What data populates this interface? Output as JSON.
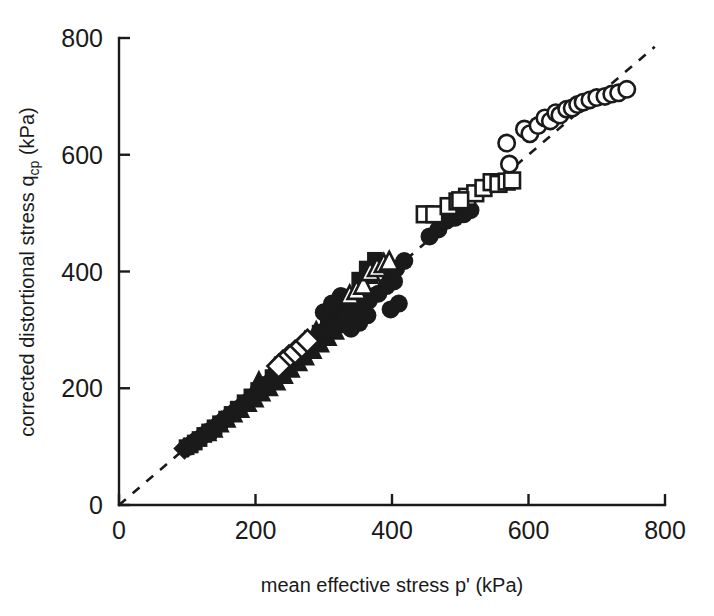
{
  "figure": {
    "background_color": "#ffffff",
    "ink_color": "#1a1a1a",
    "width": 714,
    "height": 616
  },
  "axes": {
    "x_title_main": "mean effective stress p' (kPa)",
    "y_title_part1": "corrected distortional stress q",
    "y_title_sub": "cp",
    "y_title_part2": " (kPa)",
    "x_ticks": [
      "0",
      "200",
      "400",
      "600",
      "800"
    ],
    "y_ticks": [
      "0",
      "200",
      "400",
      "600",
      "800"
    ]
  },
  "chart_data": {
    "type": "scatter",
    "title": "",
    "xlabel": "mean effective stress p' (kPa)",
    "ylabel": "corrected distortional stress q_cp (kPa)",
    "xlim": [
      0,
      800
    ],
    "ylim": [
      0,
      800
    ],
    "xticks": [
      0,
      200,
      400,
      600,
      800
    ],
    "yticks": [
      0,
      200,
      400,
      600,
      800
    ],
    "grid": false,
    "legend": "none",
    "annotations": [
      {
        "type": "reference-line",
        "style": "dashed",
        "description": "1:1 line through origin",
        "x": [
          0,
          785
        ],
        "y": [
          0,
          785
        ]
      }
    ],
    "series": [
      {
        "name": "filled-diamond",
        "marker": "diamond",
        "filled": true,
        "points": [
          [
            96,
            97
          ],
          [
            101,
            100
          ],
          [
            106,
            104
          ],
          [
            112,
            108
          ],
          [
            119,
            115
          ],
          [
            126,
            121
          ],
          [
            133,
            127
          ],
          [
            141,
            134
          ],
          [
            150,
            143
          ],
          [
            158,
            150
          ],
          [
            166,
            157
          ],
          [
            176,
            166
          ],
          [
            186,
            175
          ],
          [
            196,
            186
          ],
          [
            206,
            196
          ],
          [
            216,
            206
          ],
          [
            226,
            216
          ],
          [
            238,
            228
          ],
          [
            248,
            238
          ],
          [
            258,
            250
          ],
          [
            268,
            262
          ],
          [
            278,
            272
          ]
        ]
      },
      {
        "name": "filled-triangle",
        "marker": "triangle",
        "filled": true,
        "points": [
          [
            131,
            122
          ],
          [
            140,
            128
          ],
          [
            149,
            137
          ],
          [
            159,
            145
          ],
          [
            169,
            154
          ],
          [
            179,
            162
          ],
          [
            190,
            172
          ],
          [
            200,
            180
          ],
          [
            210,
            190
          ],
          [
            221,
            199
          ],
          [
            232,
            209
          ],
          [
            243,
            220
          ],
          [
            253,
            231
          ],
          [
            264,
            242
          ],
          [
            274,
            252
          ],
          [
            285,
            263
          ],
          [
            296,
            274
          ],
          [
            307,
            285
          ],
          [
            318,
            296
          ],
          [
            329,
            307
          ],
          [
            205,
            214
          ],
          [
            228,
            238
          ],
          [
            251,
            258
          ],
          [
            272,
            283
          ],
          [
            289,
            300
          ],
          [
            302,
            312
          ],
          [
            312,
            322
          ],
          [
            322,
            330
          ]
        ]
      },
      {
        "name": "filled-square",
        "marker": "square",
        "filled": true,
        "points": [
          [
            99,
            99
          ],
          [
            105,
            102
          ],
          [
            111,
            107
          ],
          [
            118,
            113
          ],
          [
            125,
            120
          ],
          [
            132,
            126
          ],
          [
            140,
            133
          ],
          [
            148,
            140
          ],
          [
            157,
            148
          ],
          [
            165,
            156
          ],
          [
            174,
            165
          ],
          [
            184,
            176
          ],
          [
            194,
            186
          ],
          [
            204,
            197
          ],
          [
            214,
            207
          ],
          [
            225,
            219
          ],
          [
            236,
            231
          ],
          [
            247,
            243
          ],
          [
            258,
            255
          ],
          [
            270,
            268
          ],
          [
            282,
            281
          ],
          [
            294,
            295
          ],
          [
            306,
            309
          ],
          [
            318,
            324
          ],
          [
            330,
            340
          ],
          [
            342,
            357
          ],
          [
            355,
            374
          ],
          [
            368,
            392
          ],
          [
            375,
            420
          ],
          [
            363,
            405
          ],
          [
            352,
            386
          ]
        ]
      },
      {
        "name": "filled-circle",
        "marker": "circle",
        "filled": true,
        "points": [
          [
            283,
            283
          ],
          [
            296,
            295
          ],
          [
            308,
            300
          ],
          [
            320,
            312
          ],
          [
            332,
            318
          ],
          [
            344,
            330
          ],
          [
            355,
            340
          ],
          [
            366,
            350
          ],
          [
            380,
            362
          ],
          [
            392,
            375
          ],
          [
            403,
            383
          ],
          [
            393,
            402
          ],
          [
            406,
            405
          ],
          [
            418,
            418
          ],
          [
            455,
            460
          ],
          [
            468,
            472
          ],
          [
            480,
            487
          ],
          [
            492,
            492
          ],
          [
            505,
            498
          ],
          [
            515,
            505
          ],
          [
            340,
            302
          ],
          [
            352,
            312
          ],
          [
            364,
            325
          ],
          [
            398,
            335
          ],
          [
            410,
            345
          ],
          [
            300,
            330
          ],
          [
            312,
            345
          ],
          [
            325,
            358
          ]
        ]
      },
      {
        "name": "open-diamond",
        "marker": "diamond",
        "filled": false,
        "points": [
          [
            240,
            245
          ],
          [
            249,
            254
          ],
          [
            258,
            262
          ],
          [
            268,
            272
          ],
          [
            276,
            281
          ],
          [
            234,
            238
          ]
        ]
      },
      {
        "name": "open-triangle",
        "marker": "triangle",
        "filled": false,
        "points": [
          [
            338,
            358
          ],
          [
            348,
            366
          ],
          [
            358,
            375
          ],
          [
            368,
            398
          ],
          [
            378,
            405
          ],
          [
            388,
            412
          ],
          [
            396,
            416
          ]
        ]
      },
      {
        "name": "open-square",
        "marker": "square",
        "filled": false,
        "points": [
          [
            448,
            498
          ],
          [
            462,
            498
          ],
          [
            483,
            512
          ],
          [
            496,
            520
          ],
          [
            510,
            528
          ],
          [
            522,
            534
          ],
          [
            534,
            543
          ],
          [
            546,
            553
          ],
          [
            556,
            550
          ],
          [
            568,
            554
          ],
          [
            576,
            556
          ],
          [
            500,
            522
          ]
        ]
      },
      {
        "name": "open-circle",
        "marker": "circle",
        "filled": false,
        "points": [
          [
            568,
            620
          ],
          [
            572,
            584
          ],
          [
            594,
            644
          ],
          [
            602,
            636
          ],
          [
            614,
            650
          ],
          [
            624,
            663
          ],
          [
            632,
            658
          ],
          [
            640,
            672
          ],
          [
            646,
            668
          ],
          [
            656,
            678
          ],
          [
            664,
            680
          ],
          [
            672,
            686
          ],
          [
            680,
            690
          ],
          [
            690,
            694
          ],
          [
            700,
            698
          ],
          [
            712,
            700
          ],
          [
            722,
            704
          ],
          [
            732,
            706
          ],
          [
            744,
            712
          ]
        ]
      }
    ]
  }
}
